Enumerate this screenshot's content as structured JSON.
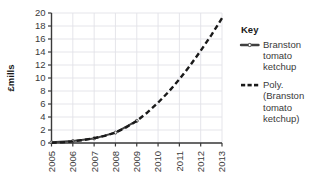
{
  "chart_data": {
    "type": "line",
    "title": "",
    "xlabel": "",
    "ylabel": "£mills",
    "categories": [
      "2005",
      "2006",
      "2007",
      "2008",
      "2009",
      "2010",
      "2011",
      "2012",
      "2013"
    ],
    "xlim": [
      2005,
      2013
    ],
    "ylim": [
      0,
      20
    ],
    "ytick_step": 2,
    "yticks": [
      "0",
      "2",
      "4",
      "6",
      "8",
      "10",
      "12",
      "14",
      "16",
      "18",
      "20"
    ],
    "grid": true,
    "legend_position": "right",
    "series": [
      {
        "name": "Branston tomato ketchup",
        "style": "solid-with-markers",
        "color": "#3f3f3f",
        "x": [
          2005,
          2006,
          2007,
          2008,
          2009
        ],
        "values": [
          0.1,
          0.3,
          0.7,
          1.6,
          3.4
        ]
      },
      {
        "name": "Poly. (Branston tomato ketchup)",
        "style": "dashed",
        "color": "#1a1a1a",
        "x": [
          2005,
          2005.5,
          2006,
          2006.5,
          2007,
          2007.5,
          2008,
          2008.5,
          2009,
          2009.5,
          2010,
          2010.5,
          2011,
          2011.5,
          2012,
          2012.5,
          2013
        ],
        "values": [
          0.05,
          0.1,
          0.25,
          0.45,
          0.75,
          1.1,
          1.6,
          2.4,
          3.4,
          4.7,
          6.2,
          7.9,
          9.8,
          11.9,
          14.2,
          16.6,
          19.2
        ]
      }
    ]
  },
  "legend": {
    "title": "Key",
    "entries": [
      {
        "marker": "solid-line-with-dot",
        "lines": [
          "Branston",
          "tomato",
          "ketchup"
        ]
      },
      {
        "marker": "dashed-line",
        "lines": [
          "Poly.",
          "(Branston",
          "tomato",
          "ketchup)"
        ]
      }
    ]
  },
  "colors": {
    "axis": "#3a3a3a",
    "grid": "#e2e2e8",
    "series_solid": "#3f3f3f",
    "series_dashed": "#1a1a1a",
    "text": "#1a1a1a",
    "background": "#ffffff"
  }
}
